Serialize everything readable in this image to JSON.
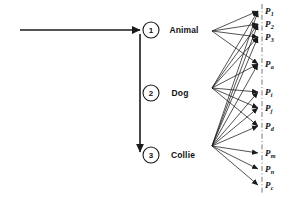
{
  "diagram": {
    "background_color": "#ffffff",
    "line_color": "#1a1a1a",
    "text_color": "#111111",
    "steps": [
      {
        "id": "step-1",
        "number": "1",
        "cx": 151,
        "cy": 30,
        "r": 8
      },
      {
        "id": "step-2",
        "number": "2",
        "cx": 151,
        "cy": 93,
        "r": 8
      },
      {
        "id": "step-3",
        "number": "3",
        "cx": 151,
        "cy": 155,
        "r": 8
      }
    ],
    "nodes": [
      {
        "id": "node-animal",
        "label": "Animal",
        "x": 184,
        "y": 30,
        "hub_x": 212,
        "hub_y": 31
      },
      {
        "id": "node-dog",
        "label": "Dog",
        "x": 180,
        "y": 93,
        "hub_x": 212,
        "hub_y": 88
      },
      {
        "id": "node-collie",
        "label": "Collie",
        "x": 183,
        "y": 155,
        "hub_x": 212,
        "hub_y": 146
      }
    ],
    "entry_arrow": {
      "x1": 20,
      "y1": 30,
      "x2": 140,
      "y2": 30
    },
    "down_arrow": {
      "x1": 140,
      "y1": 34,
      "x2": 140,
      "y2": 152
    },
    "property_axis": {
      "x": 262,
      "y1": 4,
      "y2": 194,
      "style": "dash-dot"
    },
    "properties": [
      {
        "id": "p-1",
        "base": "P",
        "sub": "1",
        "y": 11,
        "sources": [
          "node-animal",
          "node-dog",
          "node-collie"
        ]
      },
      {
        "id": "p-2",
        "base": "P",
        "sub": "2",
        "y": 24,
        "sources": [
          "node-animal",
          "node-dog",
          "node-collie"
        ]
      },
      {
        "id": "p-3",
        "base": "P",
        "sub": "3",
        "y": 37,
        "sources": [
          "node-animal",
          "node-dog",
          "node-collie"
        ]
      },
      {
        "id": "p-a",
        "base": "P",
        "sub": "a",
        "y": 64,
        "sources": [
          "node-animal",
          "node-dog",
          "node-collie"
        ]
      },
      {
        "id": "p-i",
        "base": "P",
        "sub": "i",
        "y": 92,
        "sources": [
          "node-dog",
          "node-collie"
        ]
      },
      {
        "id": "p-j",
        "base": "P",
        "sub": "j",
        "y": 108,
        "sources": [
          "node-dog",
          "node-collie"
        ]
      },
      {
        "id": "p-d",
        "base": "P",
        "sub": "d",
        "y": 126,
        "sources": [
          "node-dog",
          "node-collie"
        ]
      },
      {
        "id": "p-m",
        "base": "P",
        "sub": "m",
        "y": 153,
        "sources": [
          "node-collie"
        ]
      },
      {
        "id": "p-n",
        "base": "P",
        "sub": "n",
        "y": 169,
        "sources": [
          "node-collie"
        ]
      },
      {
        "id": "p-c",
        "base": "P",
        "sub": "c",
        "y": 185,
        "sources": [
          "node-collie"
        ]
      }
    ],
    "vertical_ellipses": [
      {
        "id": "ellipsis-upper",
        "x": 262,
        "y": 50
      },
      {
        "id": "ellipsis-mid",
        "x": 262,
        "y": 78
      },
      {
        "id": "ellipsis-lower",
        "x": 262,
        "y": 140
      }
    ]
  }
}
